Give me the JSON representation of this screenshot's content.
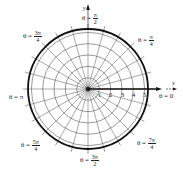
{
  "diagram": {
    "type": "polar-grid",
    "center": {
      "x": 88,
      "y": 89
    },
    "outer_radius_px": 60,
    "rings": [
      1,
      2,
      3,
      4,
      5
    ],
    "spoke_step_deg": 15,
    "axis_labels": {
      "x": "x",
      "y": "y"
    },
    "radial_ticks": [
      "1",
      "2",
      "3",
      "4",
      "5"
    ],
    "angle_labels": [
      {
        "id": "theta-0",
        "prefix": "θ = ",
        "value": "0"
      },
      {
        "id": "theta-pi-4",
        "prefix": "θ = ",
        "num": "π",
        "den": "4"
      },
      {
        "id": "theta-pi-2",
        "prefix": "θ = ",
        "num": "π",
        "den": "2"
      },
      {
        "id": "theta-3pi-4",
        "prefix": "θ = ",
        "num": "3π",
        "den": "4"
      },
      {
        "id": "theta-pi",
        "prefix": "θ = ",
        "value": "π"
      },
      {
        "id": "theta-5pi-4",
        "prefix": "θ = ",
        "num": "5π",
        "den": "4"
      },
      {
        "id": "theta-3pi-2",
        "prefix": "θ = ",
        "num": "3π",
        "den": "2"
      },
      {
        "id": "theta-7pi-4",
        "prefix": "θ = ",
        "num": "7π",
        "den": "4"
      }
    ],
    "colors": {
      "grid": "#555555",
      "outer": "#111111",
      "axis": "#111111",
      "background": "#ffffff"
    }
  }
}
